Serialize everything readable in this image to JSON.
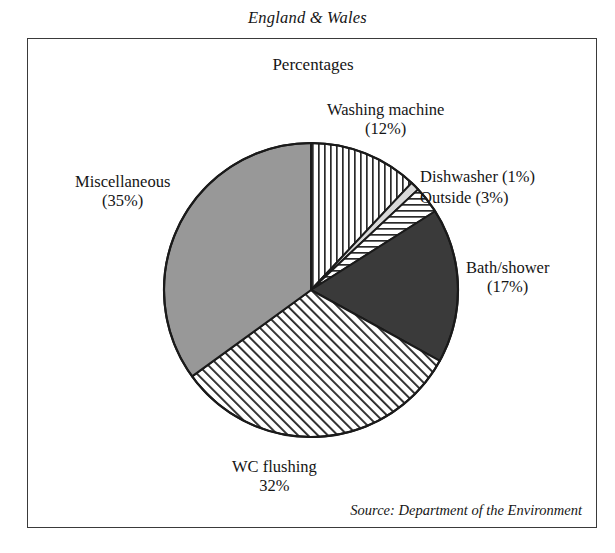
{
  "figure": {
    "title": "England & Wales",
    "subtitle": "Percentages",
    "source": "Source: Department of the Environment"
  },
  "chart_data": {
    "type": "pie",
    "title": "England & Wales",
    "subtitle": "Percentages",
    "units": "percent",
    "total": 100,
    "start_angle_deg": -90,
    "direction": "clockwise",
    "legend": "none-labels-are-callouts",
    "grid": false,
    "categories": [
      "Washing machine",
      "Dishwasher",
      "Outside",
      "Bath/shower",
      "WC flushing",
      "Miscellaneous"
    ],
    "values": [
      12,
      1,
      3,
      17,
      32,
      35
    ],
    "slices": [
      {
        "name": "Washing machine",
        "value": 12,
        "label_line1": "Washing machine",
        "label_line2": "(12%)",
        "fill_style": "vertical-hatch",
        "fill_color": "#ffffff",
        "hatch_color": "#2a2a2a",
        "start_deg": -90,
        "end_deg": -46.8
      },
      {
        "name": "Dishwasher",
        "value": 1,
        "label_line1": "Dishwasher (1%)",
        "label_line2": "",
        "fill_style": "solid",
        "fill_color": "#d9d9d9",
        "hatch_color": "",
        "start_deg": -46.8,
        "end_deg": -43.2
      },
      {
        "name": "Outside",
        "value": 3,
        "label_line1": "Outside (3%)",
        "label_line2": "",
        "fill_style": "horizontal-hatch",
        "fill_color": "#ffffff",
        "hatch_color": "#2a2a2a",
        "start_deg": -43.2,
        "end_deg": -32.4
      },
      {
        "name": "Bath/shower",
        "value": 17,
        "label_line1": "Bath/shower",
        "label_line2": "(17%)",
        "fill_style": "solid",
        "fill_color": "#3a3a3a",
        "hatch_color": "",
        "start_deg": -32.4,
        "end_deg": 28.8
      },
      {
        "name": "WC flushing",
        "value": 32,
        "label_line1": "WC flushing",
        "label_line2": "32%",
        "fill_style": "diagonal-hatch",
        "fill_color": "#ffffff",
        "hatch_color": "#2a2a2a",
        "start_deg": 28.8,
        "end_deg": 144
      },
      {
        "name": "Miscellaneous",
        "value": 35,
        "label_line1": "Miscellaneous",
        "label_line2": "(35%)",
        "fill_style": "solid",
        "fill_color": "#989898",
        "hatch_color": "",
        "start_deg": 144,
        "end_deg": 270
      }
    ],
    "geometry": {
      "center_x": 311,
      "center_y": 290,
      "radius": 147
    },
    "colors": {
      "outline": "#1a1a1a",
      "solid_dark": "#3a3a3a",
      "solid_medium": "#989898",
      "solid_light": "#d9d9d9",
      "background": "#ffffff"
    }
  }
}
